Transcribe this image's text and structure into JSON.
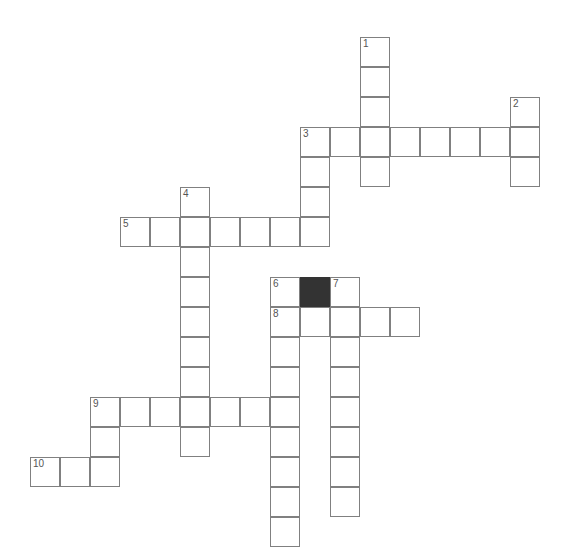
{
  "page": {
    "background_color": "#ffffff",
    "width": 561,
    "height": 551
  },
  "grid": {
    "cell_size": 30,
    "origin_x": 30,
    "origin_y": 37,
    "columns": 18,
    "rows": 17,
    "cell_fill_color": "#ffffff",
    "cell_border_color": "#808080",
    "block_color": "#333333",
    "number_color": "#555555",
    "total_white_cells": 60,
    "total_block_cells": 1
  },
  "entries": [
    {
      "number": 1,
      "direction": "down",
      "col": 11,
      "row": 0,
      "length": 5
    },
    {
      "number": 2,
      "direction": "down",
      "col": 16,
      "row": 2,
      "length": 3
    },
    {
      "number": 3,
      "direction": "across",
      "col": 9,
      "row": 3,
      "length": 8
    },
    {
      "number": 3,
      "direction": "down",
      "col": 9,
      "row": 3,
      "length": 3
    },
    {
      "number": 4,
      "direction": "down",
      "col": 5,
      "row": 5,
      "length": 9
    },
    {
      "number": 5,
      "direction": "across",
      "col": 3,
      "row": 6,
      "length": 7
    },
    {
      "number": 6,
      "direction": "down",
      "col": 8,
      "row": 8,
      "length": 9
    },
    {
      "number": 7,
      "direction": "down",
      "col": 10,
      "row": 8,
      "length": 8
    },
    {
      "number": 8,
      "direction": "across",
      "col": 8,
      "row": 9,
      "length": 5
    },
    {
      "number": 9,
      "direction": "across",
      "col": 2,
      "row": 12,
      "length": 7
    },
    {
      "number": 9,
      "direction": "down",
      "col": 2,
      "row": 12,
      "length": 3
    },
    {
      "number": 10,
      "direction": "across",
      "col": 0,
      "row": 14,
      "length": 3
    }
  ],
  "cells": [
    {
      "col": 11,
      "row": 0,
      "number": "1",
      "block": false
    },
    {
      "col": 11,
      "row": 1,
      "number": "",
      "block": false
    },
    {
      "col": 11,
      "row": 2,
      "number": "",
      "block": false
    },
    {
      "col": 16,
      "row": 2,
      "number": "2",
      "block": false
    },
    {
      "col": 9,
      "row": 3,
      "number": "3",
      "block": false
    },
    {
      "col": 10,
      "row": 3,
      "number": "",
      "block": false
    },
    {
      "col": 11,
      "row": 3,
      "number": "",
      "block": false
    },
    {
      "col": 12,
      "row": 3,
      "number": "",
      "block": false
    },
    {
      "col": 13,
      "row": 3,
      "number": "",
      "block": false
    },
    {
      "col": 14,
      "row": 3,
      "number": "",
      "block": false
    },
    {
      "col": 15,
      "row": 3,
      "number": "",
      "block": false
    },
    {
      "col": 16,
      "row": 3,
      "number": "",
      "block": false
    },
    {
      "col": 9,
      "row": 4,
      "number": "",
      "block": false
    },
    {
      "col": 11,
      "row": 4,
      "number": "",
      "block": false
    },
    {
      "col": 16,
      "row": 4,
      "number": "",
      "block": false
    },
    {
      "col": 5,
      "row": 5,
      "number": "4",
      "block": false
    },
    {
      "col": 9,
      "row": 5,
      "number": "",
      "block": false
    },
    {
      "col": 3,
      "row": 6,
      "number": "5",
      "block": false
    },
    {
      "col": 4,
      "row": 6,
      "number": "",
      "block": false
    },
    {
      "col": 5,
      "row": 6,
      "number": "",
      "block": false
    },
    {
      "col": 6,
      "row": 6,
      "number": "",
      "block": false
    },
    {
      "col": 7,
      "row": 6,
      "number": "",
      "block": false
    },
    {
      "col": 8,
      "row": 6,
      "number": "",
      "block": false
    },
    {
      "col": 9,
      "row": 6,
      "number": "",
      "block": false
    },
    {
      "col": 5,
      "row": 7,
      "number": "",
      "block": false
    },
    {
      "col": 5,
      "row": 8,
      "number": "",
      "block": false
    },
    {
      "col": 8,
      "row": 8,
      "number": "6",
      "block": false
    },
    {
      "col": 9,
      "row": 8,
      "number": "",
      "block": true
    },
    {
      "col": 10,
      "row": 8,
      "number": "7",
      "block": false
    },
    {
      "col": 5,
      "row": 9,
      "number": "",
      "block": false
    },
    {
      "col": 8,
      "row": 9,
      "number": "8",
      "block": false
    },
    {
      "col": 9,
      "row": 9,
      "number": "",
      "block": false
    },
    {
      "col": 10,
      "row": 9,
      "number": "",
      "block": false
    },
    {
      "col": 11,
      "row": 9,
      "number": "",
      "block": false
    },
    {
      "col": 12,
      "row": 9,
      "number": "",
      "block": false
    },
    {
      "col": 5,
      "row": 10,
      "number": "",
      "block": false
    },
    {
      "col": 8,
      "row": 10,
      "number": "",
      "block": false
    },
    {
      "col": 10,
      "row": 10,
      "number": "",
      "block": false
    },
    {
      "col": 5,
      "row": 11,
      "number": "",
      "block": false
    },
    {
      "col": 8,
      "row": 11,
      "number": "",
      "block": false
    },
    {
      "col": 10,
      "row": 11,
      "number": "",
      "block": false
    },
    {
      "col": 2,
      "row": 12,
      "number": "9",
      "block": false
    },
    {
      "col": 3,
      "row": 12,
      "number": "",
      "block": false
    },
    {
      "col": 4,
      "row": 12,
      "number": "",
      "block": false
    },
    {
      "col": 5,
      "row": 12,
      "number": "",
      "block": false
    },
    {
      "col": 6,
      "row": 12,
      "number": "",
      "block": false
    },
    {
      "col": 7,
      "row": 12,
      "number": "",
      "block": false
    },
    {
      "col": 8,
      "row": 12,
      "number": "",
      "block": false
    },
    {
      "col": 10,
      "row": 12,
      "number": "",
      "block": false
    },
    {
      "col": 2,
      "row": 13,
      "number": "",
      "block": false
    },
    {
      "col": 5,
      "row": 13,
      "number": "",
      "block": false
    },
    {
      "col": 8,
      "row": 13,
      "number": "",
      "block": false
    },
    {
      "col": 10,
      "row": 13,
      "number": "",
      "block": false
    },
    {
      "col": 0,
      "row": 14,
      "number": "10",
      "block": false
    },
    {
      "col": 1,
      "row": 14,
      "number": "",
      "block": false
    },
    {
      "col": 2,
      "row": 14,
      "number": "",
      "block": false
    },
    {
      "col": 8,
      "row": 14,
      "number": "",
      "block": false
    },
    {
      "col": 10,
      "row": 14,
      "number": "",
      "block": false
    },
    {
      "col": 8,
      "row": 15,
      "number": "",
      "block": false
    },
    {
      "col": 10,
      "row": 15,
      "number": "",
      "block": false
    },
    {
      "col": 8,
      "row": 16,
      "number": "",
      "block": false
    }
  ]
}
